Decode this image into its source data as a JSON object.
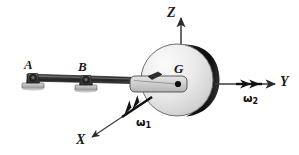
{
  "figure": {
    "kind": "engineering-mechanics-diagram",
    "background_color": "#ffffff"
  },
  "axes": {
    "z": {
      "label": "Z",
      "direction": "up"
    },
    "y": {
      "label": "Y",
      "direction": "right"
    },
    "x": {
      "label": "X",
      "direction": "down-left"
    },
    "color": "#2b2b2b"
  },
  "points": {
    "bearing_a": {
      "label": "A"
    },
    "bearing_b": {
      "label": "B"
    },
    "mass_center": {
      "label": "G"
    }
  },
  "vectors": {
    "omega1": {
      "symbol": "ω",
      "subscript": "1",
      "along": "X-axis"
    },
    "omega2": {
      "symbol": "ω",
      "subscript": "2",
      "along": "Y-axis"
    }
  },
  "colors": {
    "shaft": "#2e2e2e",
    "disk_face_light": "#f2f2f2",
    "disk_face_dark": "#c9c9c9",
    "disk_rim": "#1c1c1c",
    "yoke": "#cccccc",
    "bearing": "#5a5a5a",
    "ink": "#1a1a1a"
  }
}
